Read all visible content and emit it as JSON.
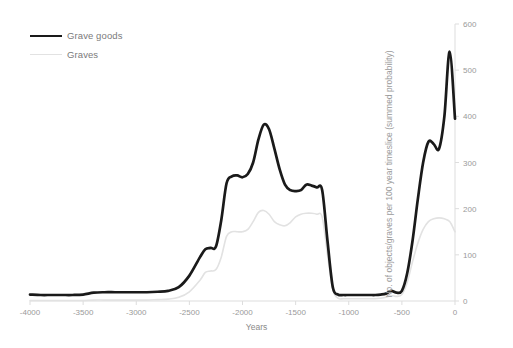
{
  "chart": {
    "type": "line",
    "x_axis_title": "Years",
    "y_axis_title": "No. of objects/graves per 100 year timeslice (summed probability)",
    "x_ticks": [
      "-4000",
      "-3500",
      "-3000",
      "-2500",
      "-2000",
      "-1500",
      "-1000",
      "-500",
      "0"
    ],
    "y_ticks": [
      "0",
      "100",
      "200",
      "300",
      "400",
      "500",
      "600"
    ],
    "legend": {
      "grave_goods_label": "Grave goods",
      "graves_label": "Graves"
    },
    "colors": {
      "grave_goods": "#1a1a1a",
      "graves": "#e2e2e2",
      "axis": "#d8d8d8",
      "tick_text": "#9a9a9a"
    }
  },
  "chart_data": {
    "type": "line",
    "title": "",
    "xlabel": "Years",
    "ylabel": "No. of objects/graves per 100 year timeslice (summed probability)",
    "xlim": [
      -4000,
      0
    ],
    "ylim": [
      0,
      600
    ],
    "xticks": [
      -4000,
      -3500,
      -3000,
      -2500,
      -2000,
      -1500,
      -1000,
      -500,
      0
    ],
    "yticks": [
      0,
      100,
      200,
      300,
      400,
      500,
      600
    ],
    "grid": false,
    "legend_position": "top-left",
    "x": [
      -4000,
      -3900,
      -3800,
      -3700,
      -3600,
      -3500,
      -3400,
      -3300,
      -3200,
      -3100,
      -3000,
      -2900,
      -2800,
      -2700,
      -2600,
      -2500,
      -2400,
      -2350,
      -2300,
      -2250,
      -2200,
      -2150,
      -2100,
      -2050,
      -2000,
      -1950,
      -1900,
      -1850,
      -1800,
      -1750,
      -1700,
      -1650,
      -1600,
      -1550,
      -1500,
      -1450,
      -1400,
      -1350,
      -1300,
      -1250,
      -1200,
      -1150,
      -1100,
      -1050,
      -1000,
      -950,
      -900,
      -850,
      -800,
      -750,
      -700,
      -650,
      -600,
      -550,
      -500,
      -450,
      -400,
      -350,
      -300,
      -250,
      -200,
      -150,
      -100,
      -50,
      0
    ],
    "series": [
      {
        "name": "Grave goods",
        "color": "#1a1a1a",
        "values": [
          14,
          13,
          13,
          13,
          13,
          14,
          18,
          19,
          19,
          19,
          19,
          19,
          20,
          22,
          30,
          55,
          95,
          112,
          115,
          118,
          175,
          255,
          270,
          272,
          268,
          275,
          300,
          350,
          382,
          372,
          330,
          285,
          252,
          240,
          238,
          240,
          252,
          250,
          246,
          240,
          130,
          30,
          14,
          13,
          13,
          13,
          13,
          13,
          13,
          13,
          14,
          16,
          22,
          18,
          22,
          60,
          130,
          220,
          300,
          345,
          340,
          330,
          400,
          540,
          395
        ]
      },
      {
        "name": "Graves",
        "color": "#e2e2e2",
        "values": [
          1,
          1,
          1,
          1,
          1,
          1,
          2,
          2,
          2,
          2,
          2,
          2,
          3,
          4,
          8,
          20,
          45,
          62,
          65,
          68,
          95,
          140,
          150,
          150,
          150,
          155,
          172,
          192,
          196,
          188,
          172,
          165,
          163,
          170,
          182,
          188,
          190,
          190,
          188,
          182,
          100,
          25,
          6,
          5,
          5,
          5,
          5,
          5,
          5,
          5,
          6,
          8,
          12,
          10,
          14,
          40,
          85,
          125,
          155,
          172,
          178,
          180,
          178,
          172,
          150
        ]
      }
    ]
  }
}
